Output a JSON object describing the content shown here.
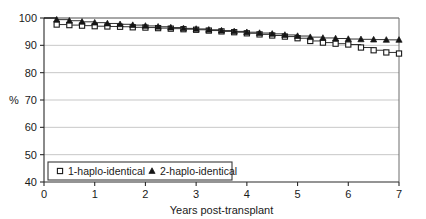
{
  "chart_data": {
    "type": "line",
    "title": "",
    "xlabel": "Years post-transplant",
    "ylabel": "%",
    "xlim": [
      0,
      7
    ],
    "ylim": [
      40,
      100
    ],
    "xticks": [
      0,
      1,
      2,
      3,
      4,
      5,
      6,
      7
    ],
    "yticks": [
      40,
      50,
      60,
      70,
      80,
      90,
      100
    ],
    "xtick_labels": [
      "0",
      "1",
      "2",
      "3",
      "4",
      "5",
      "6",
      "7"
    ],
    "ytick_labels": [
      "40",
      "50",
      "60",
      "70",
      "80",
      "90",
      "100"
    ],
    "grid": true,
    "grid_axis": "y",
    "legend_position": "bottom-left",
    "series": [
      {
        "name": "1-haplo-identical",
        "marker": "open-square",
        "x": [
          0,
          0.25,
          0.5,
          0.75,
          1.0,
          1.25,
          1.5,
          1.75,
          2.0,
          2.25,
          2.5,
          2.75,
          3.0,
          3.25,
          3.5,
          3.75,
          4.0,
          4.25,
          4.5,
          4.75,
          5.0,
          5.25,
          5.5,
          5.75,
          6.0,
          6.25,
          6.5,
          6.75,
          7.0
        ],
        "values": [
          100.0,
          97.6,
          97.4,
          97.2,
          97.0,
          96.9,
          96.8,
          96.6,
          96.5,
          96.3,
          96.1,
          95.9,
          95.7,
          95.4,
          95.1,
          94.8,
          94.4,
          94.0,
          93.6,
          93.2,
          92.6,
          91.6,
          91.0,
          90.6,
          90.3,
          89.2,
          88.2,
          87.4,
          87.0
        ]
      },
      {
        "name": "2-haplo-identical",
        "marker": "filled-triangle",
        "x": [
          0,
          0.25,
          0.5,
          0.75,
          1.0,
          1.25,
          1.5,
          1.75,
          2.0,
          2.25,
          2.5,
          2.75,
          3.0,
          3.25,
          3.5,
          3.75,
          4.0,
          4.25,
          4.5,
          4.75,
          5.0,
          5.25,
          5.5,
          5.75,
          6.0,
          6.25,
          6.5,
          6.75,
          7.0
        ],
        "values": [
          100.0,
          99.4,
          99.0,
          98.6,
          98.3,
          98.0,
          97.7,
          97.4,
          97.1,
          96.8,
          96.5,
          96.2,
          96.0,
          95.7,
          95.4,
          95.1,
          94.8,
          94.5,
          94.2,
          93.8,
          93.4,
          93.0,
          92.7,
          92.5,
          92.3,
          92.2,
          92.1,
          92.0,
          92.0
        ]
      }
    ]
  },
  "legend": {
    "entries": [
      {
        "label": "1-haplo-identical",
        "marker": "open-square"
      },
      {
        "label": "2-haplo-identical",
        "marker": "filled-triangle"
      }
    ]
  },
  "colors": {
    "series_stroke": "#1a1a1a",
    "grid": "#b9b9b9",
    "axis": "#2a2a2a",
    "background": "#ffffff"
  }
}
